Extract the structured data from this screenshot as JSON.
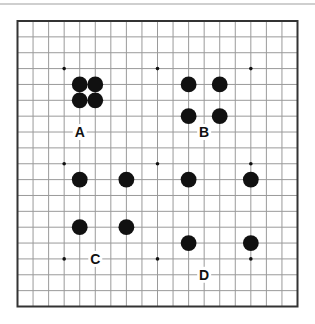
{
  "diagram": {
    "type": "go-board",
    "size": 19,
    "colors": {
      "grid": "#9a9a9a",
      "border": "#333333",
      "stone_black": "#111111",
      "hoshi": "#111111",
      "background": "#ffffff"
    },
    "hoshi": [
      [
        3,
        3
      ],
      [
        9,
        3
      ],
      [
        15,
        3
      ],
      [
        3,
        9
      ],
      [
        9,
        9
      ],
      [
        15,
        9
      ],
      [
        3,
        15
      ],
      [
        9,
        15
      ],
      [
        15,
        15
      ]
    ],
    "groups": [
      {
        "label": "A",
        "label_pos": [
          4,
          7
        ],
        "stones": [
          [
            4,
            4
          ],
          [
            5,
            4
          ],
          [
            4,
            5
          ],
          [
            5,
            5
          ]
        ]
      },
      {
        "label": "B",
        "label_pos": [
          12,
          7
        ],
        "stones": [
          [
            11,
            4
          ],
          [
            13,
            4
          ],
          [
            11,
            6
          ],
          [
            13,
            6
          ]
        ]
      },
      {
        "label": "C",
        "label_pos": [
          5,
          15
        ],
        "stones": [
          [
            4,
            10
          ],
          [
            7,
            10
          ],
          [
            4,
            13
          ],
          [
            7,
            13
          ]
        ]
      },
      {
        "label": "D",
        "label_pos": [
          12,
          16
        ],
        "stones": [
          [
            11,
            10
          ],
          [
            15,
            10
          ],
          [
            11,
            14
          ],
          [
            15,
            14
          ]
        ]
      }
    ]
  }
}
